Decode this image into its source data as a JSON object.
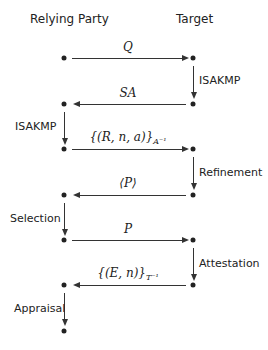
{
  "headers": {
    "left": "Relying Party",
    "right": "Target"
  },
  "messages": [
    {
      "label": "Q",
      "direction": "right"
    },
    {
      "label": "SA",
      "direction": "left"
    },
    {
      "label": "{(R, n, a)}",
      "sub": "A⁻¹",
      "direction": "right"
    },
    {
      "label": "⟨P⟩",
      "direction": "left"
    },
    {
      "label": "P",
      "direction": "right"
    },
    {
      "label": "{(E, n)}",
      "sub": "T⁻¹",
      "direction": "left"
    }
  ],
  "steps": [
    {
      "label": "ISAKMP",
      "side": "right"
    },
    {
      "label": "ISAKMP",
      "side": "left"
    },
    {
      "label": "Refinement",
      "side": "right"
    },
    {
      "label": "Selection",
      "side": "left"
    },
    {
      "label": "Attestation",
      "side": "right"
    },
    {
      "label": "Appraisal",
      "side": "left"
    }
  ]
}
